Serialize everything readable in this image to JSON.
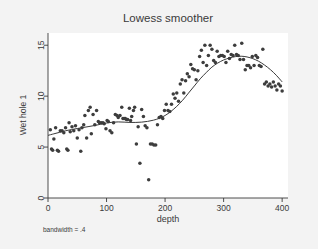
{
  "figure": {
    "background_color": "#f3f3f3",
    "plot_background_color": "#ffffff",
    "ink_color": "#3a3a3a",
    "marker_color": "#3d3d3d",
    "curve_color": "#3a3a3a"
  },
  "chart_data": {
    "type": "scatter",
    "title": "Lowess smoother",
    "xlabel": "depth",
    "ylabel": "Wet hole 1",
    "note": "bandwidth = .4",
    "xlim": [
      0,
      410
    ],
    "ylim": [
      0,
      16.2
    ],
    "xticks": [
      0,
      100,
      200,
      300,
      400
    ],
    "xticklabels": [
      "0",
      "100",
      "200",
      "300",
      "400"
    ],
    "yticks": [
      0,
      5,
      10,
      15
    ],
    "yticklabels": [
      "0",
      "5",
      "10",
      "15"
    ],
    "grid": false,
    "legend": false,
    "marker": "filled-circle",
    "series": [
      {
        "name": "observations",
        "kind": "scatter",
        "x": [
          4,
          6,
          8,
          10,
          13,
          16,
          18,
          21,
          24,
          27,
          30,
          32,
          34,
          36,
          38,
          41,
          44,
          47,
          50,
          53,
          56,
          58,
          61,
          63,
          66,
          69,
          72,
          74,
          77,
          80,
          83,
          86,
          88,
          91,
          94,
          96,
          99,
          101,
          103,
          106,
          109,
          112,
          115,
          118,
          120,
          123,
          126,
          128,
          130,
          132,
          134,
          136,
          139,
          141,
          143,
          146,
          148,
          151,
          154,
          157,
          160,
          163,
          166,
          169,
          172,
          175,
          178,
          181,
          184,
          187,
          190,
          193,
          196,
          199,
          202,
          205,
          208,
          211,
          214,
          217,
          220,
          223,
          226,
          229,
          232,
          235,
          238,
          241,
          244,
          247,
          250,
          253,
          256,
          259,
          262,
          265,
          268,
          271,
          274,
          277,
          280,
          283,
          286,
          289,
          292,
          295,
          298,
          301,
          304,
          307,
          310,
          313,
          316,
          319,
          322,
          325,
          328,
          331,
          334,
          337,
          340,
          343,
          346,
          349,
          352,
          355,
          358,
          361,
          364,
          367,
          370,
          373,
          376,
          379,
          382,
          385,
          388,
          391,
          394,
          397,
          400
        ],
        "y": [
          6.7,
          4.8,
          4.7,
          5.8,
          6.9,
          4.7,
          4.6,
          6.6,
          6.6,
          6.4,
          6.9,
          4.8,
          4.7,
          7.4,
          6.5,
          7.0,
          6.6,
          7.1,
          5.9,
          6.7,
          4.6,
          6.9,
          7.2,
          8.1,
          5.9,
          8.6,
          8.9,
          6.3,
          8.2,
          7.2,
          8.6,
          7.5,
          7.4,
          7.4,
          7.4,
          7.3,
          6.8,
          7.6,
          7.5,
          6.6,
          6.4,
          7.4,
          8.2,
          8.1,
          7.9,
          8.1,
          8.9,
          7.8,
          7.8,
          7.8,
          7.7,
          7.7,
          8.8,
          7.6,
          8.0,
          8.6,
          8.9,
          5.3,
          7.0,
          3.4,
          8.7,
          8.0,
          7.1,
          6.9,
          1.8,
          5.3,
          5.3,
          5.2,
          5.2,
          7.2,
          7.9,
          8.0,
          7.8,
          8.6,
          9.2,
          8.6,
          8.5,
          9.2,
          10.2,
          9.8,
          10.3,
          9.5,
          11.2,
          11.6,
          10.3,
          11.5,
          12.2,
          11.9,
          13.1,
          12.7,
          12.6,
          11.6,
          12.5,
          13.9,
          14.5,
          13.3,
          15.0,
          13.0,
          14.0,
          15.0,
          14.6,
          13.5,
          13.3,
          14.4,
          13.9,
          14.0,
          14.0,
          13.9,
          13.3,
          14.4,
          13.7,
          14.1,
          14.0,
          15.0,
          14.1,
          14.0,
          13.6,
          15.2,
          13.6,
          12.6,
          13.0,
          13.0,
          12.8,
          13.9,
          13.0,
          14.0,
          13.8,
          13.0,
          12.9,
          14.6,
          11.2,
          11.4,
          11.0,
          11.2,
          10.9,
          11.4,
          11.0,
          10.6,
          11.2,
          11.0,
          10.5
        ]
      },
      {
        "name": "lowess smooth",
        "kind": "line",
        "x": [
          0,
          10,
          20,
          30,
          40,
          50,
          60,
          70,
          80,
          90,
          100,
          110,
          120,
          130,
          140,
          150,
          160,
          170,
          180,
          190,
          200,
          210,
          220,
          230,
          240,
          250,
          260,
          270,
          280,
          290,
          300,
          310,
          320,
          330,
          340,
          350,
          360,
          370,
          380,
          390,
          400
        ],
        "y": [
          6.15,
          6.3,
          6.45,
          6.6,
          6.72,
          6.82,
          6.92,
          7.02,
          7.12,
          7.24,
          7.36,
          7.44,
          7.47,
          7.45,
          7.42,
          7.42,
          7.45,
          7.52,
          7.64,
          7.82,
          8.1,
          8.5,
          9.0,
          9.6,
          10.3,
          11.0,
          11.7,
          12.3,
          12.85,
          13.25,
          13.55,
          13.75,
          13.88,
          13.92,
          13.85,
          13.68,
          13.42,
          13.05,
          12.6,
          12.05,
          11.4
        ]
      }
    ]
  }
}
